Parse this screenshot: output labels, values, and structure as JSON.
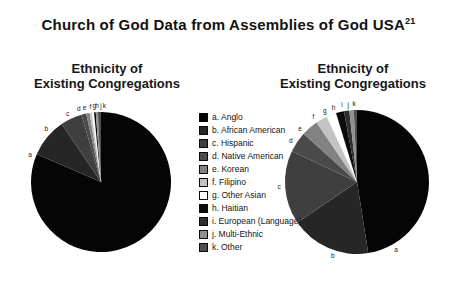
{
  "figure": {
    "title": "Church of God Data from Assemblies of God USA",
    "title_superscript": "21",
    "background": "#ffffff"
  },
  "palette": {
    "a": "#050505",
    "b": "#262626",
    "c": "#3f3f3f",
    "d": "#4a4a4a",
    "e": "#828282",
    "f": "#c3c3c3",
    "g": "#ffffff",
    "h": "#0b0b0b",
    "i": "#2f2f2f",
    "j": "#909090",
    "k": "#4f4f4f"
  },
  "legend": {
    "position": "center-between-pies",
    "items": [
      {
        "key": "a",
        "label": "a. Anglo"
      },
      {
        "key": "b",
        "label": "b. African American"
      },
      {
        "key": "c",
        "label": "c. Hispanic"
      },
      {
        "key": "d",
        "label": "d. Native American"
      },
      {
        "key": "e",
        "label": "e. Korean"
      },
      {
        "key": "f",
        "label": "f. Filipino"
      },
      {
        "key": "g",
        "label": "g. Other Asian"
      },
      {
        "key": "h",
        "label": "h. Haitian"
      },
      {
        "key": "i",
        "label": "i. European (Language)"
      },
      {
        "key": "j",
        "label": "j. Multi-Ethnic"
      },
      {
        "key": "k",
        "label": "k. Other"
      }
    ]
  },
  "chart_data": [
    {
      "type": "pie",
      "id": "left",
      "title_lines": [
        "Ethnicity of",
        "Existing Congregations"
      ],
      "start_angle_deg": 0,
      "direction": "clockwise",
      "radius": 70,
      "label_radius": 76,
      "slices": [
        {
          "key": "a",
          "category": "Anglo",
          "percent": 81.5,
          "label_angle": 291
        },
        {
          "key": "b",
          "category": "African American",
          "percent": 9.0,
          "label_angle": 314
        },
        {
          "key": "c",
          "category": "Hispanic",
          "percent": 5.0,
          "label_angle": 334
        },
        {
          "key": "d",
          "category": "Native American",
          "percent": 1.1,
          "label_angle": 343
        },
        {
          "key": "e",
          "category": "Korean",
          "percent": 0.8,
          "label_angle": 347.5
        },
        {
          "key": "f",
          "category": "Filipino",
          "percent": 0.5,
          "label_angle": 352
        },
        {
          "key": "g",
          "category": "Other Asian",
          "percent": 0.5,
          "label_angle": 355
        },
        {
          "key": "h",
          "category": "Haitian",
          "percent": 0.4,
          "label_angle": 357
        },
        {
          "key": "i",
          "category": "European (Language)",
          "percent": 0.0,
          "label_angle": null
        },
        {
          "key": "j",
          "category": "Multi-Ethnic",
          "percent": 0.5,
          "label_angle": 0
        },
        {
          "key": "k",
          "category": "Other",
          "percent": 0.7,
          "label_angle": 2.5
        }
      ]
    },
    {
      "type": "pie",
      "id": "right",
      "title_lines": [
        "Ethnicity of",
        "Existing Congregations"
      ],
      "start_angle_deg": 0,
      "direction": "clockwise",
      "radius": 72,
      "label_radius": 78,
      "slices": [
        {
          "key": "a",
          "category": "Anglo",
          "percent": 47.5,
          "label_angle": 150
        },
        {
          "key": "b",
          "category": "African American",
          "percent": 18.0,
          "label_angle": 198
        },
        {
          "key": "c",
          "category": "Hispanic",
          "percent": 16.5,
          "label_angle": 266
        },
        {
          "key": "d",
          "category": "Native American",
          "percent": 4.7,
          "label_angle": 302
        },
        {
          "key": "e",
          "category": "Korean",
          "percent": 3.8,
          "label_angle": 313
        },
        {
          "key": "f",
          "category": "Filipino",
          "percent": 2.6,
          "label_angle": 326
        },
        {
          "key": "g",
          "category": "Other Asian",
          "percent": 2.2,
          "label_angle": 335.5
        },
        {
          "key": "h",
          "category": "Haitian",
          "percent": 1.8,
          "label_angle": 342.5
        },
        {
          "key": "i",
          "category": "European (Language)",
          "percent": 1.2,
          "label_angle": 349
        },
        {
          "key": "j",
          "category": "Multi-Ethnic",
          "percent": 1.0,
          "label_angle": 353.5
        },
        {
          "key": "k",
          "category": "Other",
          "percent": 0.7,
          "label_angle": 357.8
        }
      ]
    }
  ]
}
